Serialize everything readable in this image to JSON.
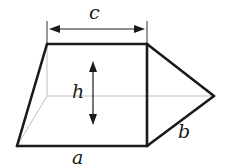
{
  "diagram": {
    "type": "geometric-solid",
    "labels": {
      "top_width": "c",
      "height": "h",
      "bottom_edge": "a",
      "slant_edge": "b"
    },
    "colors": {
      "line": "#1a1a1a",
      "hidden_line": "#b8b8b8",
      "background": "#ffffff"
    }
  }
}
